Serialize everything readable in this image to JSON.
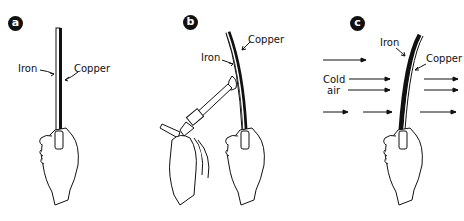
{
  "figure": {
    "panels": [
      {
        "badge": "a",
        "labels": {
          "iron": "Iron",
          "copper": "Copper"
        }
      },
      {
        "badge": "b",
        "labels": {
          "iron": "Iron",
          "copper": "Copper"
        }
      },
      {
        "badge": "c",
        "labels": {
          "iron": "Iron",
          "copper": "Copper",
          "cold_air_1": "Cold",
          "cold_air_2": "air"
        }
      }
    ]
  }
}
